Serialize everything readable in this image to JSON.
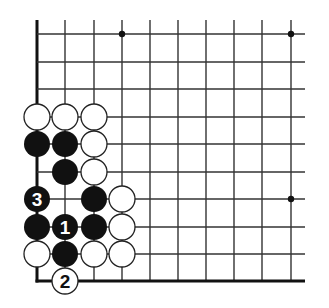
{
  "diagram": {
    "type": "go-board-corner",
    "colors": {
      "background": "#ffffff",
      "line": "#333333",
      "edge": "#111111",
      "black_stone": "#111111",
      "white_stone": "#ffffff",
      "stone_outline": "#222222"
    },
    "grid": {
      "cols_x": [
        37,
        65,
        94,
        122,
        150,
        178,
        206,
        234,
        262,
        291
      ],
      "rows_y": [
        34,
        62,
        89,
        117,
        144,
        172,
        199,
        227,
        254,
        281
      ],
      "top_extent": 20,
      "right_extent": 305,
      "left_edge_thick": true,
      "bottom_edge_thick": true
    },
    "star_points": [
      {
        "col": 3,
        "row": 0
      },
      {
        "col": 9,
        "row": 0
      },
      {
        "col": 9,
        "row": 6
      }
    ],
    "stones": [
      {
        "col": 0,
        "row": 3,
        "color": "white",
        "label": ""
      },
      {
        "col": 1,
        "row": 3,
        "color": "white",
        "label": ""
      },
      {
        "col": 2,
        "row": 3,
        "color": "white",
        "label": ""
      },
      {
        "col": 0,
        "row": 4,
        "color": "black",
        "label": ""
      },
      {
        "col": 1,
        "row": 4,
        "color": "black",
        "label": ""
      },
      {
        "col": 2,
        "row": 4,
        "color": "white",
        "label": ""
      },
      {
        "col": 1,
        "row": 5,
        "color": "black",
        "label": ""
      },
      {
        "col": 2,
        "row": 5,
        "color": "white",
        "label": ""
      },
      {
        "col": 0,
        "row": 6,
        "color": "black",
        "label": "3"
      },
      {
        "col": 2,
        "row": 6,
        "color": "black",
        "label": ""
      },
      {
        "col": 3,
        "row": 6,
        "color": "white",
        "label": ""
      },
      {
        "col": 0,
        "row": 7,
        "color": "black",
        "label": ""
      },
      {
        "col": 1,
        "row": 7,
        "color": "black",
        "label": "1"
      },
      {
        "col": 2,
        "row": 7,
        "color": "black",
        "label": ""
      },
      {
        "col": 3,
        "row": 7,
        "color": "white",
        "label": ""
      },
      {
        "col": 0,
        "row": 8,
        "color": "white",
        "label": ""
      },
      {
        "col": 1,
        "row": 8,
        "color": "black",
        "label": ""
      },
      {
        "col": 2,
        "row": 8,
        "color": "white",
        "label": ""
      },
      {
        "col": 3,
        "row": 8,
        "color": "white",
        "label": ""
      },
      {
        "col": 1,
        "row": 9,
        "color": "white",
        "label": "2"
      }
    ],
    "move_labels": [
      "1",
      "2",
      "3"
    ]
  }
}
